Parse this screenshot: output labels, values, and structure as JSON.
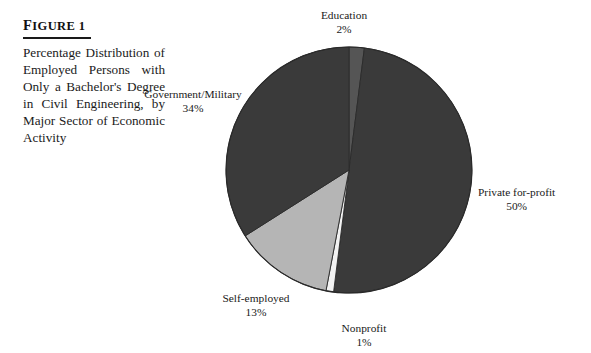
{
  "figure": {
    "label": "Figure 1",
    "label_first_letter": "F",
    "label_rest": "IGURE 1",
    "caption": "Percentage Distribution of Employed Persons with Only a Bachelor's Degree in Civil Engineering, by Major Sector of Economic Activity"
  },
  "chart_data": {
    "type": "pie",
    "title": "Percentage Distribution of Employed Persons with Only a Bachelor's Degree in Civil Engineering, by Major Sector of Economic Activity",
    "unit": "percent",
    "total": 100,
    "legend": "none",
    "labels_position": "outside",
    "start_angle_deg": 0,
    "direction": "clockwise",
    "categories": [
      "Education",
      "Private for-profit",
      "Nonprofit",
      "Self-employed",
      "Government/Military"
    ],
    "values": [
      2,
      50,
      1,
      13,
      34
    ],
    "slices": [
      {
        "name": "Education",
        "value": 2,
        "value_label": "2%",
        "color": "#555555",
        "start_deg": 0,
        "end_deg": 7.2
      },
      {
        "name": "Private for-profit",
        "value": 50,
        "value_label": "50%",
        "color": "#3a3a3a",
        "start_deg": 7.2,
        "end_deg": 187.2
      },
      {
        "name": "Nonprofit",
        "value": 1,
        "value_label": "1%",
        "color": "#f2f2f2",
        "start_deg": 187.2,
        "end_deg": 190.8
      },
      {
        "name": "Self-employed",
        "value": 13,
        "value_label": "13%",
        "color": "#b5b5b5",
        "start_deg": 190.8,
        "end_deg": 237.6
      },
      {
        "name": "Government/Military",
        "value": 34,
        "value_label": "34%",
        "color": "#3a3a3a",
        "start_deg": 237.6,
        "end_deg": 360
      }
    ],
    "geometry": {
      "center_x": 349,
      "center_y": 170,
      "radius": 123
    },
    "colors": {
      "dark": "#3a3a3a",
      "mid_dark": "#555555",
      "mid_gray": "#b5b5b5",
      "light": "#f2f2f2",
      "outline": "#2a2a2a",
      "background": "#ffffff"
    }
  }
}
